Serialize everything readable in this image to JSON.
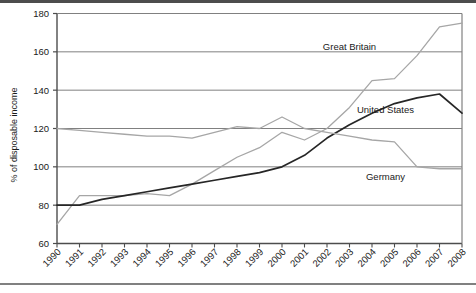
{
  "chart_data": {
    "type": "line",
    "title": "",
    "xlabel": "",
    "ylabel": "% of disposable income",
    "xlim": [
      1990,
      2008
    ],
    "ylim": [
      60,
      180
    ],
    "yticks": [
      60,
      80,
      100,
      120,
      140,
      160,
      180
    ],
    "grid": true,
    "legend_position": "inline-annotations",
    "x": [
      1990,
      1991,
      1992,
      1993,
      1994,
      1995,
      1996,
      1997,
      1998,
      1999,
      2000,
      2001,
      2002,
      2003,
      2004,
      2005,
      2006,
      2007,
      2008
    ],
    "categories": [
      "1990",
      "1991",
      "1992",
      "1993",
      "1994",
      "1995",
      "1996",
      "1997",
      "1998",
      "1999",
      "2000",
      "2001",
      "2002",
      "2003",
      "2004",
      "2005",
      "2006",
      "2007",
      "2008"
    ],
    "series": [
      {
        "name": "Great Britain",
        "color": "#a6a6a6",
        "values": [
          70,
          85,
          85,
          85,
          86,
          85,
          91,
          98,
          105,
          110,
          118,
          114,
          120,
          131,
          145,
          146,
          158,
          173,
          175
        ]
      },
      {
        "name": "United States",
        "color": "#262626",
        "values": [
          80,
          80,
          83,
          85,
          87,
          89,
          91,
          93,
          95,
          97,
          100,
          106,
          115,
          122,
          128,
          133,
          136,
          138,
          128
        ]
      },
      {
        "name": "Germany",
        "color": "#a6a6a6",
        "values": [
          120,
          119,
          118,
          117,
          116,
          116,
          115,
          118,
          121,
          120,
          126,
          120,
          118,
          116,
          114,
          113,
          100,
          99,
          99
        ]
      }
    ],
    "annotations": [
      {
        "text": "Great Britain",
        "x": 2003.0,
        "y": 161
      },
      {
        "text": "United States",
        "x": 2004.6,
        "y": 128
      },
      {
        "text": "Germany",
        "x": 2004.6,
        "y": 93
      }
    ]
  },
  "axis": {
    "y_title": "% of disposable income",
    "y_tick_labels": [
      "180",
      "160",
      "140",
      "120",
      "100",
      "80",
      "60"
    ],
    "x_tick_labels": [
      "1990",
      "1991",
      "1992",
      "1993",
      "1994",
      "1995",
      "1996",
      "1997",
      "1998",
      "1999",
      "2000",
      "2001",
      "2002",
      "2003",
      "2004",
      "2005",
      "2006",
      "2007",
      "2008"
    ]
  },
  "colors": {
    "grid": "#808080",
    "axis": "#4d4d4d",
    "light_series": "#a6a6a6",
    "dark_series": "#262626",
    "background": "#ffffff"
  }
}
